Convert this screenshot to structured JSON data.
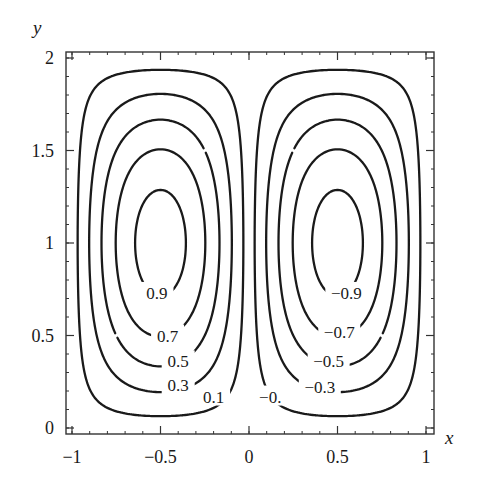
{
  "chart_data": {
    "type": "contour",
    "title": "",
    "xlabel": "x",
    "ylabel": "y",
    "xlim": [
      -1,
      1
    ],
    "ylim": [
      0,
      2
    ],
    "grid": false,
    "legend": null,
    "function": "psi(x,y) = -sin(pi*x) * sin(pi*y/2)",
    "levels": [
      0.9,
      0.7,
      0.5,
      0.3,
      0.1,
      -0.1,
      -0.3,
      -0.5,
      -0.7,
      -0.9
    ],
    "x_ticks": [
      {
        "value": -1,
        "label": "−1"
      },
      {
        "value": -0.5,
        "label": "−0.5"
      },
      {
        "value": 0,
        "label": "0"
      },
      {
        "value": 0.5,
        "label": "0.5"
      },
      {
        "value": 1,
        "label": "1"
      }
    ],
    "y_ticks": [
      {
        "value": 0,
        "label": "0"
      },
      {
        "value": 0.5,
        "label": "0.5"
      },
      {
        "value": 1,
        "label": "1"
      },
      {
        "value": 1.5,
        "label": "1.5"
      },
      {
        "value": 2,
        "label": "2"
      }
    ],
    "contour_labels": [
      {
        "text": "0.9",
        "x": -0.52,
        "y": 0.73
      },
      {
        "text": "0.7",
        "x": -0.46,
        "y": 0.5
      },
      {
        "text": "0.5",
        "x": -0.4,
        "y": 0.36
      },
      {
        "text": "0.3",
        "x": -0.4,
        "y": 0.23
      },
      {
        "text": "0.1",
        "x": -0.2,
        "y": 0.17
      },
      {
        "text": "−0.",
        "x": 0.12,
        "y": 0.17
      },
      {
        "text": "−0.3",
        "x": 0.4,
        "y": 0.22
      },
      {
        "text": "−0.5",
        "x": 0.45,
        "y": 0.36
      },
      {
        "text": "−0.7",
        "x": 0.51,
        "y": 0.52
      },
      {
        "text": "−0.9",
        "x": 0.55,
        "y": 0.73
      }
    ],
    "colors": {
      "line": "#1a1a1a",
      "background": "#ffffff"
    }
  }
}
